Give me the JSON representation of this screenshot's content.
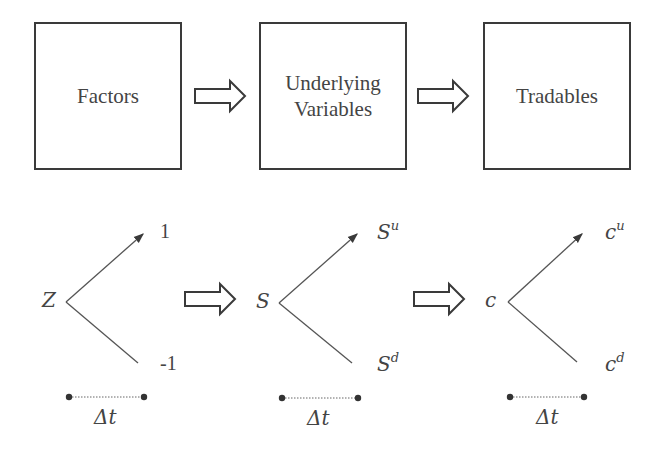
{
  "top_row": {
    "boxes": [
      {
        "label": "Factors"
      },
      {
        "label": "Underlying\nVariables"
      },
      {
        "label": "Tradables"
      }
    ]
  },
  "trees": [
    {
      "root": "Z",
      "up": "1",
      "down": "-1",
      "up_sup": "",
      "down_sup": "",
      "interval": "Δt"
    },
    {
      "root": "S",
      "up": "S",
      "down": "S",
      "up_sup": "u",
      "down_sup": "d",
      "interval": "Δt"
    },
    {
      "root": "c",
      "up": "c",
      "down": "c",
      "up_sup": "u",
      "down_sup": "d",
      "interval": "Δt"
    }
  ],
  "colors": {
    "stroke": "#3a3a3a",
    "text": "#444444",
    "background": "#ffffff"
  }
}
